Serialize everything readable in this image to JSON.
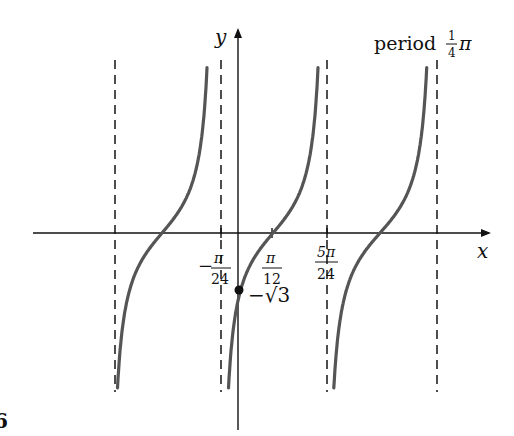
{
  "chart_data": {
    "type": "line",
    "title": "",
    "function": "y = tan(4x - pi/3)",
    "xlabel": "x",
    "ylabel": "y",
    "annotation": "period 1/4 π",
    "period_label": {
      "text": "period",
      "fraction_num": "1",
      "fraction_den": "4",
      "symbol": "π"
    },
    "x_ticks": [
      {
        "label_num": "π",
        "label_den": "24",
        "sign": "−",
        "value": "-π/24"
      },
      {
        "label_num": "π",
        "label_den": "12",
        "sign": "",
        "value": "π/12"
      },
      {
        "label_num": "5π",
        "label_den": "24",
        "sign": "",
        "value": "5π/24"
      }
    ],
    "asymptotes": [
      "-7π/24",
      "-π/24",
      "5π/24",
      "11π/24"
    ],
    "zeros": [
      "-π/6",
      "π/12",
      "π/3"
    ],
    "marked_point": {
      "x": 0,
      "y": "-√3",
      "label": "−√3"
    },
    "grid": false,
    "legend": null,
    "series": [
      {
        "name": "branch-1",
        "domain": [
          "-7π/24",
          "-π/24"
        ]
      },
      {
        "name": "branch-2",
        "domain": [
          "-π/24",
          "5π/24"
        ]
      },
      {
        "name": "branch-3",
        "domain": [
          "5π/24",
          "11π/24"
        ]
      }
    ],
    "figure_number_fragment": "6"
  },
  "colors": {
    "curve": "#555555",
    "axis": "#111111",
    "asymptote": "#222222"
  }
}
